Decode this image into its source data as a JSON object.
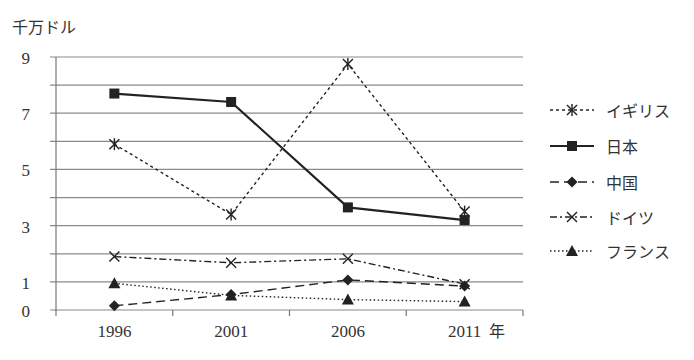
{
  "chart_data": {
    "type": "line",
    "title": "",
    "unit_label": "千万ドル",
    "xlabel": "年",
    "ylabel": "千万ドル",
    "categories": [
      "1996",
      "2001",
      "2006",
      "2011"
    ],
    "category_suffix": "年",
    "ylim": [
      0,
      9
    ],
    "y_ticks": [
      0,
      1,
      3,
      5,
      7,
      9
    ],
    "y_gridlines": [
      0,
      1,
      2,
      3,
      4,
      5,
      6,
      7,
      8,
      9
    ],
    "grid": true,
    "legend_position": "right",
    "series": [
      {
        "name": "イギリス",
        "values": [
          5.9,
          3.4,
          8.75,
          3.5
        ],
        "marker": "asterisk",
        "line": "dashed-short"
      },
      {
        "name": "日本",
        "values": [
          7.7,
          7.4,
          3.65,
          3.2
        ],
        "marker": "square",
        "line": "solid"
      },
      {
        "name": "中国",
        "values": [
          0.15,
          0.55,
          1.07,
          0.85
        ],
        "marker": "diamond",
        "line": "dashed-long"
      },
      {
        "name": "ドイツ",
        "values": [
          1.9,
          1.68,
          1.82,
          0.92
        ],
        "marker": "x",
        "line": "dash-dot"
      },
      {
        "name": "フランス",
        "values": [
          0.95,
          0.52,
          0.37,
          0.3
        ],
        "marker": "triangle",
        "line": "dotted"
      }
    ]
  },
  "unit_label": "千万ドル",
  "legend": [
    {
      "label": "イギリス"
    },
    {
      "label": "日本"
    },
    {
      "label": "中国"
    },
    {
      "label": "ドイツ"
    },
    {
      "label": "フランス"
    }
  ]
}
